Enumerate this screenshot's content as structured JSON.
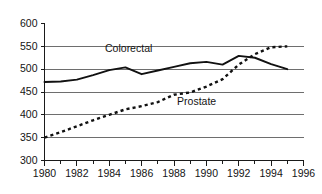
{
  "chart_data": {
    "type": "line",
    "title": "",
    "subtitle": "",
    "xlabel": "",
    "ylabel": "",
    "x": [
      1980,
      1981,
      1982,
      1983,
      1984,
      1985,
      1986,
      1987,
      1988,
      1989,
      1990,
      1991,
      1992,
      1993,
      1994,
      1995
    ],
    "xlim": [
      1980,
      1996
    ],
    "ylim": [
      300,
      600
    ],
    "grid": "horizontal",
    "legend_position": "inline-annotations",
    "x_ticks_major": [
      1980,
      1982,
      1984,
      1986,
      1988,
      1990,
      1992,
      1994,
      1996
    ],
    "x_ticks_minor": [
      1981,
      1983,
      1985,
      1987,
      1989,
      1991,
      1993,
      1995
    ],
    "x_tick_labels": [
      "1980",
      "1982",
      "1984",
      "1986",
      "1988",
      "1990",
      "1992",
      "1994",
      "1996"
    ],
    "y_ticks": [
      300,
      350,
      400,
      450,
      500,
      550,
      600
    ],
    "y_tick_labels": [
      "300",
      "350",
      "400",
      "450",
      "500",
      "550",
      "600"
    ],
    "series": [
      {
        "name": "Colorectal",
        "style": "solid",
        "color": "#111111",
        "label_x": 1985.2,
        "label_y": 537,
        "values": [
          472,
          473,
          477,
          487,
          498,
          504,
          489,
          497,
          505,
          513,
          516,
          510,
          529,
          525,
          511,
          500
        ]
      },
      {
        "name": "Prostate",
        "style": "dotted",
        "color": "#111111",
        "label_x": 1989.4,
        "label_y": 421,
        "values": [
          350,
          362,
          375,
          388,
          400,
          412,
          419,
          428,
          444,
          449,
          462,
          478,
          510,
          533,
          548,
          550
        ]
      }
    ]
  },
  "axis_colors": {
    "gridline": "#6e6e6e",
    "axis": "#1a1a1a",
    "text": "#141414",
    "background": "#ffffff"
  }
}
